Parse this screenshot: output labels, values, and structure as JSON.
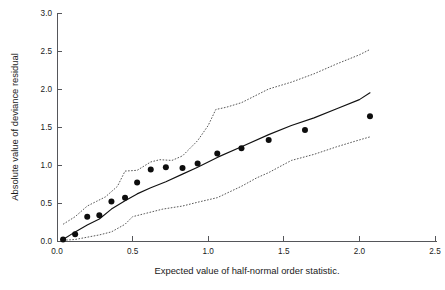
{
  "chart_data": {
    "type": "scatter",
    "title": "",
    "xlabel": "Expected value of half-normal order statistic.",
    "ylabel": "Absolute value of deviance residual",
    "xlim": [
      0.0,
      2.5
    ],
    "ylim": [
      0.0,
      3.0
    ],
    "xticks": [
      "0.0",
      "0.5",
      "1.0",
      "1.5",
      "2.0",
      "2.5"
    ],
    "xtick_values": [
      0.0,
      0.5,
      1.0,
      1.5,
      2.0,
      2.5
    ],
    "yticks": [
      "0.0",
      "0.5",
      "1.0",
      "1.5",
      "2.0",
      "2.5",
      "3.0"
    ],
    "ytick_values": [
      0.0,
      0.5,
      1.0,
      1.5,
      2.0,
      2.5,
      3.0
    ],
    "grid": false,
    "legend": "none",
    "series": [
      {
        "name": "Observed absolute deviance residuals",
        "marker": "filled-circle",
        "marker_color": "#0d0d0d",
        "points": [
          [
            0.04,
            0.02
          ],
          [
            0.12,
            0.09
          ],
          [
            0.2,
            0.32
          ],
          [
            0.28,
            0.34
          ],
          [
            0.36,
            0.52
          ],
          [
            0.45,
            0.57
          ],
          [
            0.53,
            0.77
          ],
          [
            0.62,
            0.94
          ],
          [
            0.72,
            0.97
          ],
          [
            0.83,
            0.96
          ],
          [
            0.93,
            1.02
          ],
          [
            1.06,
            1.15
          ],
          [
            1.22,
            1.22
          ],
          [
            1.4,
            1.33
          ],
          [
            1.64,
            1.46
          ],
          [
            2.07,
            1.64
          ]
        ]
      },
      {
        "name": "Simulated mean (fitted line)",
        "style": "solid",
        "color": "#111111",
        "points": [
          [
            0.04,
            0.02
          ],
          [
            0.12,
            0.12
          ],
          [
            0.2,
            0.21
          ],
          [
            0.28,
            0.29
          ],
          [
            0.36,
            0.42
          ],
          [
            0.45,
            0.53
          ],
          [
            0.53,
            0.62
          ],
          [
            0.62,
            0.7
          ],
          [
            0.72,
            0.78
          ],
          [
            0.83,
            0.88
          ],
          [
            0.93,
            0.97
          ],
          [
            1.06,
            1.1
          ],
          [
            1.22,
            1.24
          ],
          [
            1.4,
            1.4
          ],
          [
            1.55,
            1.52
          ],
          [
            1.7,
            1.62
          ],
          [
            1.85,
            1.74
          ],
          [
            2.0,
            1.86
          ],
          [
            2.07,
            1.95
          ]
        ]
      },
      {
        "name": "Upper simulation envelope",
        "style": "dotted",
        "color": "#3a3a3a",
        "points": [
          [
            0.04,
            0.22
          ],
          [
            0.12,
            0.32
          ],
          [
            0.2,
            0.46
          ],
          [
            0.26,
            0.52
          ],
          [
            0.32,
            0.58
          ],
          [
            0.4,
            0.72
          ],
          [
            0.45,
            0.92
          ],
          [
            0.53,
            0.93
          ],
          [
            0.62,
            1.04
          ],
          [
            0.68,
            1.07
          ],
          [
            0.76,
            1.06
          ],
          [
            0.83,
            1.12
          ],
          [
            0.93,
            1.32
          ],
          [
            1.0,
            1.52
          ],
          [
            1.05,
            1.73
          ],
          [
            1.12,
            1.76
          ],
          [
            1.22,
            1.82
          ],
          [
            1.4,
            2.0
          ],
          [
            1.55,
            2.09
          ],
          [
            1.7,
            2.2
          ],
          [
            1.85,
            2.33
          ],
          [
            2.0,
            2.45
          ],
          [
            2.07,
            2.52
          ]
        ]
      },
      {
        "name": "Lower simulation envelope",
        "style": "dotted",
        "color": "#3a3a3a",
        "points": [
          [
            0.04,
            0.01
          ],
          [
            0.12,
            0.02
          ],
          [
            0.2,
            0.05
          ],
          [
            0.28,
            0.08
          ],
          [
            0.36,
            0.12
          ],
          [
            0.45,
            0.22
          ],
          [
            0.5,
            0.32
          ],
          [
            0.58,
            0.36
          ],
          [
            0.7,
            0.42
          ],
          [
            0.83,
            0.46
          ],
          [
            0.93,
            0.51
          ],
          [
            1.06,
            0.57
          ],
          [
            1.22,
            0.72
          ],
          [
            1.32,
            0.83
          ],
          [
            1.4,
            0.9
          ],
          [
            1.55,
            1.06
          ],
          [
            1.7,
            1.14
          ],
          [
            1.85,
            1.24
          ],
          [
            2.0,
            1.33
          ],
          [
            2.07,
            1.37
          ]
        ]
      }
    ]
  },
  "axes": {
    "x_label": "Expected value of half-normal order statistic.",
    "y_label": "Absolute value of deviance residual"
  }
}
